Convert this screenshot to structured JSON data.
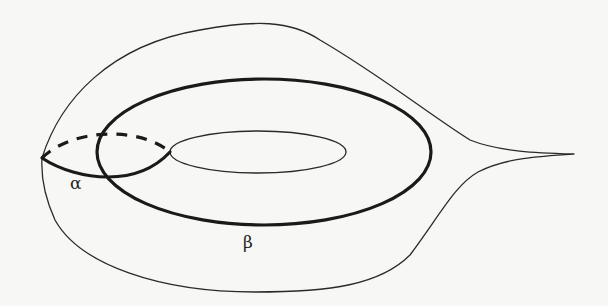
{
  "figure": {
    "labels": {
      "alpha": "α",
      "beta": "β"
    },
    "curves": [
      {
        "id": "surface-outline",
        "style": "thin",
        "role": "outer boundary of surface"
      },
      {
        "id": "hole",
        "style": "thin",
        "role": "inner hole of torus"
      },
      {
        "id": "alpha",
        "style": "thick",
        "role": "meridian curve (front solid, back dashed)",
        "label": "α"
      },
      {
        "id": "beta",
        "style": "thick",
        "role": "longitude curve around hole",
        "label": "β"
      }
    ],
    "colors": {
      "background": "#f7f7f5",
      "stroke": "#1a1a1a"
    }
  }
}
